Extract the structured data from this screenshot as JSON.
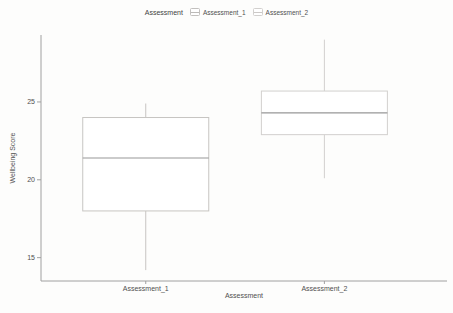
{
  "chart_data": {
    "type": "boxplot",
    "title": "",
    "xlabel": "Assessment",
    "ylabel": "Wellbeing Score",
    "ylim": [
      13.5,
      29.3
    ],
    "yticks": [
      25,
      20,
      15
    ],
    "grid": false,
    "panel_border": false,
    "categories": [
      "Assessment_1",
      "Assessment_2"
    ],
    "series": [
      {
        "name": "Assessment_1",
        "min": 14.2,
        "q1": 18.0,
        "median": 21.4,
        "q3": 24.0,
        "max": 24.9,
        "outline": "#c7c5c2"
      },
      {
        "name": "Assessment_2",
        "min": 20.1,
        "q1": 22.9,
        "median": 24.3,
        "q3": 25.7,
        "max": 29.0,
        "outline": "#d2d0ce"
      }
    ],
    "legend": {
      "position": "top",
      "title": "Assessment",
      "entries": [
        "Assessment_1",
        "Assessment_2"
      ]
    }
  },
  "colors": {
    "background": "#fdfdfc",
    "axis": "#a0a0a0",
    "text": "#4f4f4f",
    "median": "#979797",
    "box_fill": "#ffffff"
  }
}
